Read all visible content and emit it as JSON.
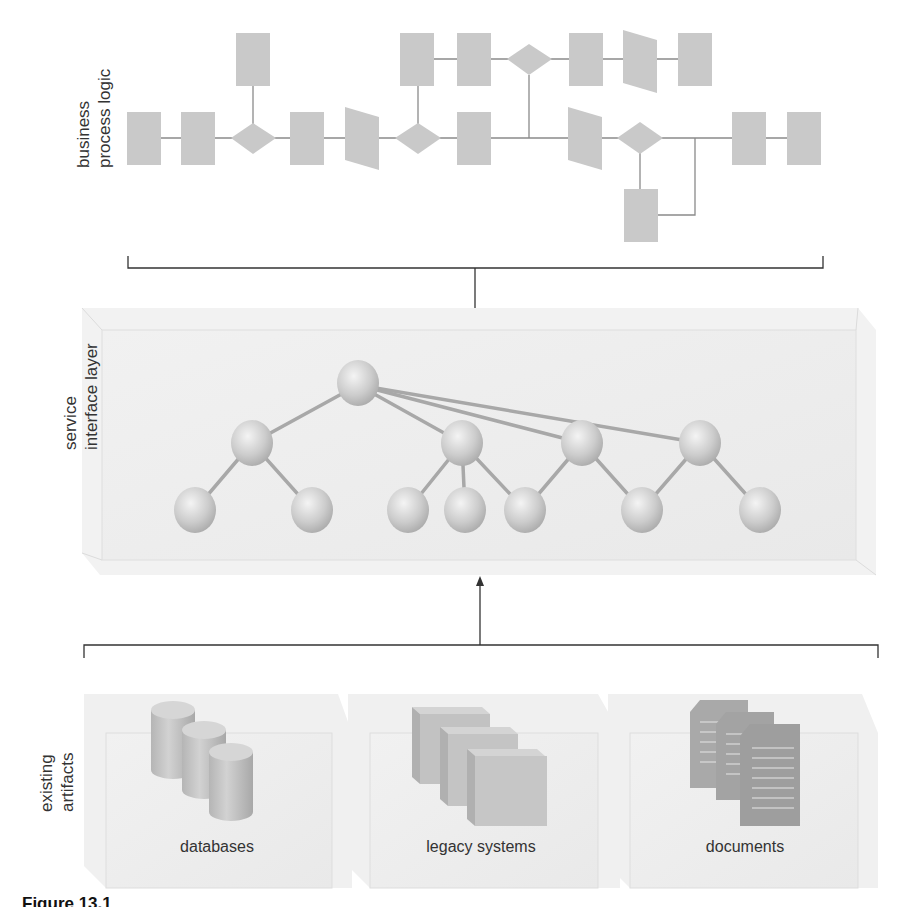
{
  "layers": {
    "business_process": {
      "label_line1": "business",
      "label_line2": "process logic"
    },
    "service_interface": {
      "label_line1": "service",
      "label_line2": "interface layer"
    },
    "existing_artifacts": {
      "label_line1": "existing",
      "label_line2": "artifacts",
      "items": [
        {
          "label": "databases",
          "icon": "database-icon"
        },
        {
          "label": "legacy systems",
          "icon": "server-stack-icon"
        },
        {
          "label": "documents",
          "icon": "documents-icon"
        }
      ]
    }
  },
  "caption": "Figure 13.1",
  "colors": {
    "shape_fill": "#c9c9c9",
    "connector": "#8a8a8a",
    "box_fill": "#efefef",
    "node_fill": "#cfcfcf",
    "edge": "#a8a8a8",
    "bracket": "#333333"
  }
}
